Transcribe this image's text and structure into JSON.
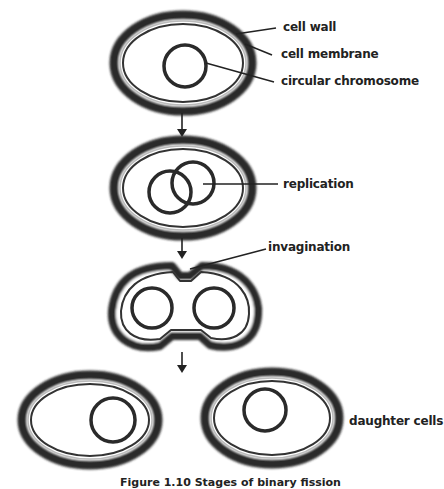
{
  "diagram": {
    "labels": {
      "cell_wall": "cell wall",
      "cell_membrane": "cell membrane",
      "circular_chromosome": "circular chromosome",
      "replication": "replication",
      "invagination": "invagination",
      "daughter_cells": "daughter cells"
    },
    "stages": [
      "cell with circular chromosome",
      "replication",
      "invagination",
      "daughter cells"
    ],
    "caption": "Figure 1.10  Stages of binary fission"
  }
}
